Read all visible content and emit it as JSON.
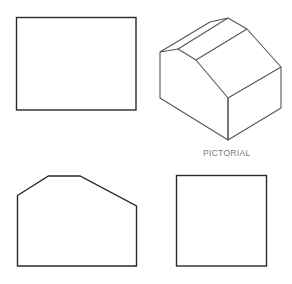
{
  "figure": {
    "type": "orthographic-projection",
    "views": {
      "top_view": {
        "shape": "rectangle"
      },
      "pictorial": {
        "shape": "isometric-gable-roof-block",
        "label": "PICTORIAL"
      },
      "front_view": {
        "shape": "pentagon-with-chamfered-top"
      },
      "side_view": {
        "shape": "square"
      }
    }
  },
  "colors": {
    "line": "#2a2a2a",
    "pictorial_line": "#555555",
    "label": "#7a7a7a",
    "background": "#ffffff"
  }
}
